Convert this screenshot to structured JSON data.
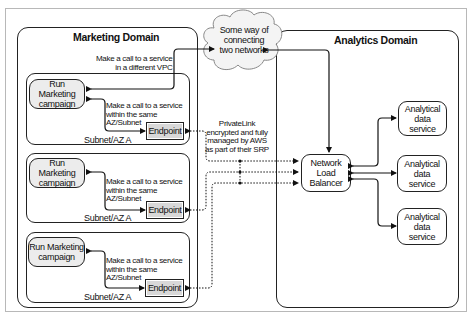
{
  "diagram": {
    "marketing_domain": {
      "title": "Marketing Domain",
      "cross_vpc_call_label_line1": "Make a call to a service",
      "cross_vpc_call_label_line2": "in a different VPC",
      "subnets": [
        {
          "label": "Subnet/AZ A",
          "campaign_line1": "Run Marketing",
          "campaign_line2": "campaign",
          "call_label_line1": "Make a call to a service",
          "call_label_line2": "within the same",
          "call_label_line3": "AZ/Subnet",
          "endpoint": "Endpoint"
        },
        {
          "label": "Subnet/AZ A",
          "campaign_line1": "Run Marketing",
          "campaign_line2": "campaign",
          "call_label_line1": "Make a call to a service",
          "call_label_line2": "within the same",
          "call_label_line3": "AZ/Subnet",
          "endpoint": "Endpoint"
        },
        {
          "label": "Subnet/AZ A",
          "campaign_line1": "Run Marketing",
          "campaign_line2": "campaign",
          "call_label_line1": "Make a call to a service",
          "call_label_line2": "within the same",
          "call_label_line3": "AZ/Subnet",
          "endpoint": "Endpoint"
        }
      ]
    },
    "cloud": {
      "line1": "Some way of",
      "line2": "connecting",
      "line3": "two networks"
    },
    "privatelink_label": {
      "line1": "PrivateLink",
      "line2": "encrypted and fully",
      "line3": "managed by AWS",
      "line4": "as part of their SRP"
    },
    "analytics_domain": {
      "title": "Analytics Domain",
      "nlb_line1": "Network",
      "nlb_line2": "Load",
      "nlb_line3": "Balancer",
      "services": [
        {
          "line1": "Analytical",
          "line2": "data",
          "line3": "service"
        },
        {
          "line1": "Analytical",
          "line2": "data",
          "line3": "service"
        },
        {
          "line1": "Analytical",
          "line2": "data",
          "line3": "service"
        }
      ]
    },
    "colors": {
      "node_fill": "#ececec",
      "endpoint_fill": "#d8d8d8",
      "stroke": "#222222",
      "frame_border": "#b8b8b8"
    }
  }
}
